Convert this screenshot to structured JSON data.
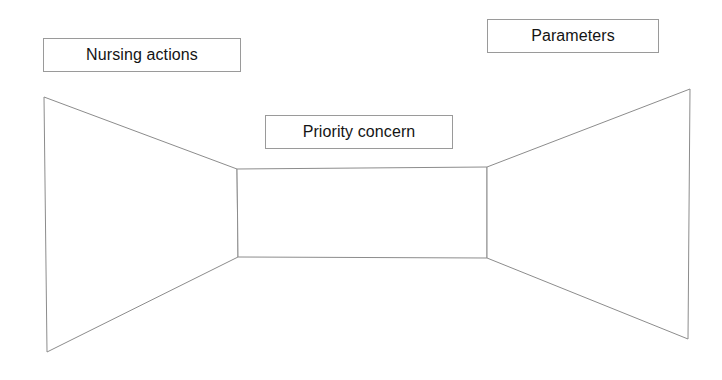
{
  "diagram": {
    "background_color": "#ffffff",
    "stroke_color": "#8c8c8c",
    "text_color": "#141414",
    "labels": {
      "left": "Nursing actions",
      "center": "Priority concern",
      "right": "Parameters"
    },
    "shapes": {
      "left_wing": {
        "name": "left-trapezoid",
        "points": "44,97 237,169 238,257 47,352"
      },
      "center": {
        "name": "center-rectangle",
        "points": "237,169 487,167 487,258 238,257"
      },
      "right_wing": {
        "name": "right-trapezoid",
        "points": "487,167 690,89 688,339 487,258"
      }
    }
  }
}
